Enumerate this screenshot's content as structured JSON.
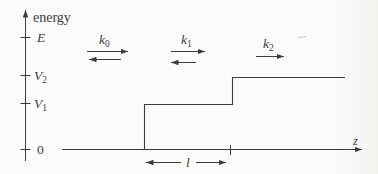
{
  "colors": {
    "ink": "#3c3c3c",
    "background": "#fbfbfa"
  },
  "energy_axis": {
    "label": "energy",
    "ticks": [
      {
        "name": "E",
        "base": "E",
        "sub": ""
      },
      {
        "name": "V2",
        "base": "V",
        "sub": "2"
      },
      {
        "name": "V1",
        "base": "V",
        "sub": "1"
      },
      {
        "name": "zero",
        "base": "0",
        "sub": ""
      }
    ]
  },
  "z_axis": {
    "label": "z"
  },
  "wave_vectors": [
    {
      "name": "k0",
      "base": "k",
      "sub": "0",
      "directions": [
        "right",
        "left"
      ]
    },
    {
      "name": "k1",
      "base": "k",
      "sub": "1",
      "directions": [
        "right",
        "left"
      ]
    },
    {
      "name": "k2",
      "base": "k",
      "sub": "2",
      "directions": [
        "right"
      ]
    }
  ],
  "barrier_width": {
    "label": "l"
  }
}
